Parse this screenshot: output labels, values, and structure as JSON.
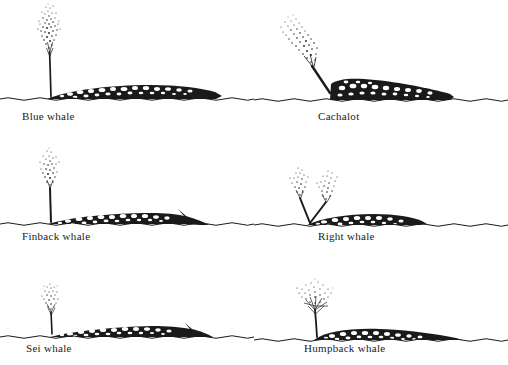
{
  "plate": {
    "title": "Whale blow (spout) identification plate",
    "medium": "pen-and-ink stipple engraving",
    "background_color": "#ffffff",
    "ink_color": "#1a1a1a",
    "columns": 2,
    "rows": 3
  },
  "figures": [
    {
      "id": "blue-whale",
      "label": "Blue whale",
      "spout": {
        "name": "single tall vertical column",
        "direction": "vertical",
        "height_px": 80,
        "shape": "narrow stalk widening into a tall slender stippled plume",
        "angle_deg": 0
      },
      "body": {
        "name": "long low mottled back",
        "length_px": 150,
        "profile": "very long, low, nearly flat back with small tail fluke at right",
        "blowhole_x_ratio": 0.1
      }
    },
    {
      "id": "cachalot",
      "label": "Cachalot",
      "spout": {
        "name": "single angled forward-leaning column",
        "direction": "forward-left diagonal",
        "height_px": 62,
        "shape": "bushy plume projecting obliquely up and to the left from the snout",
        "angle_deg": 45
      },
      "body": {
        "name": "blunt high-browed back",
        "length_px": 130,
        "profile": "tall squared head at left tapering down to a low ridged back",
        "blowhole_x_ratio": 0.05
      }
    },
    {
      "id": "finback-whale",
      "label": "Finback whale",
      "spout": {
        "name": "single narrow vertical column",
        "direction": "vertical",
        "height_px": 56,
        "shape": "slim upright stalk opening to a small stippled cloud",
        "angle_deg": 0
      },
      "body": {
        "name": "long slender back with dorsal fin",
        "length_px": 148,
        "profile": "long low back ending in a small pointed dorsal fin and fluke",
        "blowhole_x_ratio": 0.08
      }
    },
    {
      "id": "right-whale",
      "label": "Right whale",
      "spout": {
        "name": "divided V-shaped double column",
        "direction": "two diverging jets",
        "height_px": 40,
        "shape": "two separate plumes forming a wide V above the head",
        "angle_deg": 30
      },
      "body": {
        "name": "short rounded back",
        "length_px": 110,
        "profile": "short, thick, smoothly arched back with no dorsal fin",
        "blowhole_x_ratio": 0.08
      }
    },
    {
      "id": "sei-whale",
      "label": "Sei whale",
      "spout": {
        "name": "short low vertical column",
        "direction": "vertical",
        "height_px": 38,
        "shape": "short slender stalk with a small sparse tuft",
        "angle_deg": 0
      },
      "body": {
        "name": "long flat back",
        "length_px": 150,
        "profile": "long flat stippled back barely rising from the water",
        "blowhole_x_ratio": 0.07
      }
    },
    {
      "id": "humpback-whale",
      "label": "Humpback whale",
      "spout": {
        "name": "broad bushy tree-shaped column",
        "direction": "vertical, spreading",
        "height_px": 46,
        "shape": "wide low bush spreading outward like the crown of a tree",
        "angle_deg": 0
      },
      "body": {
        "name": "humped knobbly back",
        "length_px": 140,
        "profile": "rounded humped back with knobbly ridge and broad tail",
        "blowhole_x_ratio": 0.08
      }
    }
  ],
  "waterline": {
    "name": "sea surface",
    "style": "thin hand-drawn wavy line running the full width of each figure"
  }
}
